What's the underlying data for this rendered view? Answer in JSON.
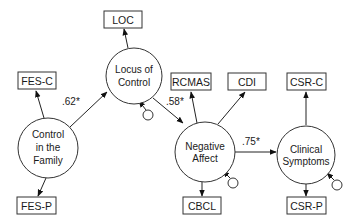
{
  "diagram": {
    "type": "structural-equation-model",
    "latent_variables": [
      {
        "id": "control_family",
        "label_lines": [
          "Control",
          "in the",
          "Family"
        ]
      },
      {
        "id": "locus_control",
        "label_lines": [
          "Locus of",
          "Control"
        ]
      },
      {
        "id": "negative_affect",
        "label_lines": [
          "Negative",
          "Affect"
        ]
      },
      {
        "id": "clinical_symptoms",
        "label_lines": [
          "Clinical",
          "Symptoms"
        ]
      }
    ],
    "indicators": [
      {
        "id": "fes_c",
        "label": "FES-C",
        "latent": "control_family"
      },
      {
        "id": "fes_p",
        "label": "FES-P",
        "latent": "control_family"
      },
      {
        "id": "loc",
        "label": "LOC",
        "latent": "locus_control"
      },
      {
        "id": "rcmas",
        "label": "RCMAS",
        "latent": "negative_affect"
      },
      {
        "id": "cdi",
        "label": "CDI",
        "latent": "negative_affect"
      },
      {
        "id": "cbcl",
        "label": "CBCL",
        "latent": "negative_affect"
      },
      {
        "id": "csr_c",
        "label": "CSR-C",
        "latent": "clinical_symptoms"
      },
      {
        "id": "csr_p",
        "label": "CSR-P",
        "latent": "clinical_symptoms"
      }
    ],
    "paths": [
      {
        "from": "control_family",
        "to": "locus_control",
        "coefficient": ".62*"
      },
      {
        "from": "locus_control",
        "to": "negative_affect",
        "coefficient": ".58*"
      },
      {
        "from": "negative_affect",
        "to": "clinical_symptoms",
        "coefficient": ".75*"
      }
    ],
    "disturbances": [
      "locus_control",
      "negative_affect",
      "clinical_symptoms"
    ]
  }
}
